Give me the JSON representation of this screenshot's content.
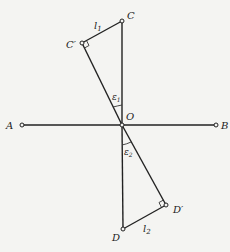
{
  "diagram": {
    "points": {
      "A": {
        "label": "A",
        "x": 22,
        "y": 125
      },
      "B": {
        "label": "B",
        "x": 216,
        "y": 125
      },
      "O": {
        "label": "O",
        "x": 122,
        "y": 125
      },
      "C": {
        "label": "C",
        "x": 122,
        "y": 21
      },
      "C_prime": {
        "label": "C′",
        "x": 82,
        "y": 43
      },
      "D": {
        "label": "D",
        "x": 123,
        "y": 229
      },
      "D_prime": {
        "label": "D′",
        "x": 166,
        "y": 205
      }
    },
    "labels": {
      "A": "A",
      "B": "B",
      "O": "O",
      "C": "C",
      "C_prime": "C′",
      "D": "D",
      "D_prime": "D′",
      "l1": "l",
      "l1_sub": "1",
      "l2": "l",
      "l2_sub": "2",
      "eps1": "ε",
      "eps1_sub": "1",
      "eps2": "ε",
      "eps2_sub": "2"
    },
    "segments": [
      [
        "A",
        "B"
      ],
      [
        "O",
        "C"
      ],
      [
        "O",
        "C_prime"
      ],
      [
        "C",
        "C_prime"
      ],
      [
        "O",
        "D"
      ],
      [
        "O",
        "D_prime"
      ],
      [
        "D",
        "D_prime"
      ]
    ],
    "right_angles": [
      "C_prime",
      "D_prime"
    ],
    "angles": [
      "eps1 between OC and OC′",
      "eps2 between OD and OD′"
    ]
  }
}
